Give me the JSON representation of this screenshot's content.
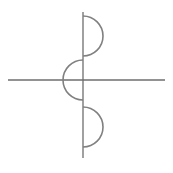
{
  "figure": {
    "background_color": "#ffffff",
    "width": 173,
    "height": 173
  },
  "style": {
    "stroke_color": "#787878",
    "axis_stroke_color": "#6e6e6e",
    "arc_stroke_color": "#808080",
    "axis_stroke_width": 1.3,
    "arc_stroke_width": 1.6
  },
  "chart_data": {
    "type": "line",
    "xlabel": "",
    "ylabel": "",
    "grid": false,
    "legend": false,
    "axes": {
      "origin": {
        "x": 83,
        "y": 80
      },
      "horizontal": {
        "x1": 8,
        "y1": 80,
        "x2": 165,
        "y2": 80,
        "label": "x-axis"
      },
      "vertical": {
        "x1": 83,
        "y1": 12,
        "x2": 83,
        "y2": 158,
        "label": "y-axis"
      }
    },
    "series": [
      {
        "name": "upper-arc",
        "shape": "semicircle",
        "center": {
          "x": 83,
          "y": 36
        },
        "radius": 20,
        "opens": "right",
        "start": {
          "x": 83,
          "y": 16
        },
        "end": {
          "x": 83,
          "y": 56
        },
        "extreme": {
          "x": 103,
          "y": 36
        }
      },
      {
        "name": "middle-arc",
        "shape": "semicircle",
        "center": {
          "x": 83,
          "y": 80
        },
        "radius": 20,
        "opens": "left",
        "start": {
          "x": 83,
          "y": 60
        },
        "end": {
          "x": 83,
          "y": 100
        },
        "extreme": {
          "x": 63,
          "y": 80
        }
      },
      {
        "name": "lower-arc",
        "shape": "semicircle",
        "center": {
          "x": 83,
          "y": 127
        },
        "radius": 20,
        "opens": "right",
        "start": {
          "x": 83,
          "y": 107
        },
        "end": {
          "x": 83,
          "y": 147
        },
        "extreme": {
          "x": 103,
          "y": 127
        }
      }
    ]
  }
}
